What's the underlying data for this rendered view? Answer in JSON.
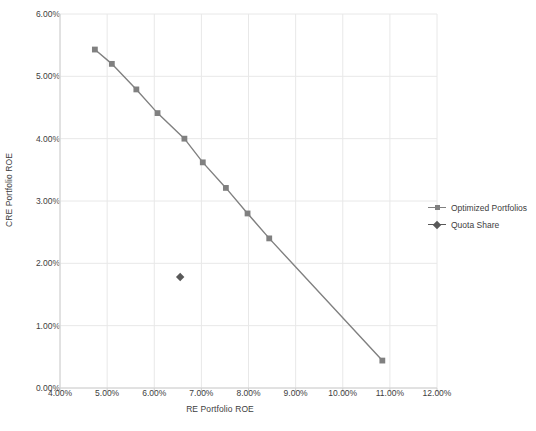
{
  "chart_data": {
    "type": "scatter",
    "title": "",
    "xlabel": "RE Portfolio ROE",
    "ylabel": "CRE Portfolio ROE",
    "xlim": [
      4.0,
      12.0
    ],
    "ylim": [
      0.0,
      6.0
    ],
    "xtick_labels": [
      "4.00%",
      "5.00%",
      "6.00%",
      "7.00%",
      "8.00%",
      "9.00%",
      "10.00%",
      "11.00%",
      "12.00%"
    ],
    "xtick_values": [
      4.0,
      5.0,
      6.0,
      7.0,
      8.0,
      9.0,
      10.0,
      11.0,
      12.0
    ],
    "ytick_labels": [
      "0.00%",
      "1.00%",
      "2.00%",
      "3.00%",
      "4.00%",
      "5.00%",
      "6.00%"
    ],
    "ytick_values": [
      0.0,
      1.0,
      2.0,
      3.0,
      4.0,
      5.0,
      6.0
    ],
    "grid": true,
    "legend_position": "right",
    "series": [
      {
        "name": "Optimized Portfolios",
        "marker": "square",
        "line": true,
        "color": "#808080",
        "points": [
          {
            "x": 4.74,
            "y": 5.43
          },
          {
            "x": 5.1,
            "y": 5.2
          },
          {
            "x": 5.62,
            "y": 4.79
          },
          {
            "x": 6.07,
            "y": 4.41
          },
          {
            "x": 6.64,
            "y": 4.0
          },
          {
            "x": 7.03,
            "y": 3.62
          },
          {
            "x": 7.52,
            "y": 3.21
          },
          {
            "x": 7.98,
            "y": 2.8
          },
          {
            "x": 8.44,
            "y": 2.4
          },
          {
            "x": 10.84,
            "y": 0.44
          }
        ]
      },
      {
        "name": "Quota Share",
        "marker": "diamond",
        "line": false,
        "color": "#595959",
        "points": [
          {
            "x": 6.55,
            "y": 1.78
          }
        ]
      }
    ]
  },
  "legend": {
    "items": [
      {
        "label": "Optimized Portfolios"
      },
      {
        "label": "Quota Share"
      }
    ]
  },
  "colors": {
    "series_optimized": "#808080",
    "series_quota": "#595959",
    "grid": "#e8e8e8",
    "axis": "#d0d0d0",
    "text": "#404040"
  }
}
